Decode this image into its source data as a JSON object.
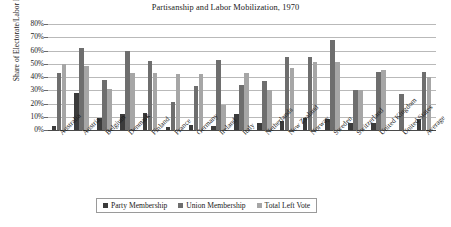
{
  "chart_data": {
    "type": "bar",
    "title": "Partisanship and Labor Mobilization, 1970",
    "xlabel": "",
    "ylabel": "Share of Electorate/Labor Force",
    "ylim": [
      0,
      80
    ],
    "ytick_labels": [
      "0%",
      "10%",
      "20%",
      "30%",
      "40%",
      "50%",
      "60%",
      "70%",
      "80%"
    ],
    "ytick_values": [
      0,
      10,
      20,
      30,
      40,
      50,
      60,
      70,
      80
    ],
    "grid": true,
    "legend_position": "bottom",
    "categories": [
      "Australia",
      "Austria",
      "Belgium",
      "Denmark",
      "Finland",
      "France",
      "Germany",
      "Ireland",
      "Italy",
      "Netherlands",
      "New Zealand",
      "Norway",
      "Sweden",
      "Switzerland",
      "United Kingdom",
      "United States",
      "Average"
    ],
    "series": [
      {
        "name": "Party Membership",
        "color": "#3b3b3b",
        "values": [
          3,
          28,
          9,
          12,
          13,
          2,
          4,
          3,
          12,
          5,
          7,
          9,
          8,
          5,
          5,
          null,
          8
        ]
      },
      {
        "name": "Union Membership",
        "color": "#6e6e6e",
        "values": [
          43,
          62,
          38,
          60,
          52,
          21,
          33,
          53,
          34,
          37,
          55,
          55,
          68,
          30,
          44,
          27,
          44
        ]
      },
      {
        "name": "Total Left Vote",
        "color": "#a6a6a6",
        "values": [
          50,
          48,
          31,
          43,
          43,
          42,
          42,
          19,
          43,
          30,
          47,
          51,
          51,
          30,
          45,
          null,
          40
        ]
      }
    ]
  }
}
